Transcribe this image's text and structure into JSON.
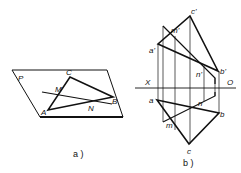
{
  "diagram_a": {
    "caption": "a )",
    "plane_label": "P",
    "points": {
      "A": "A",
      "B": "B",
      "C": "C",
      "M": "M",
      "N": "N"
    }
  },
  "diagram_b": {
    "caption": "b )",
    "axis": {
      "left": "X",
      "right": "O"
    },
    "front_view": {
      "a": "a'",
      "b": "b'",
      "c": "c'",
      "m": "m'",
      "n": "n'"
    },
    "top_view": {
      "a": "a",
      "b": "b",
      "c": "c",
      "m": "m",
      "n": "n"
    }
  },
  "colors": {
    "line": "#111111",
    "background": "#ffffff"
  }
}
